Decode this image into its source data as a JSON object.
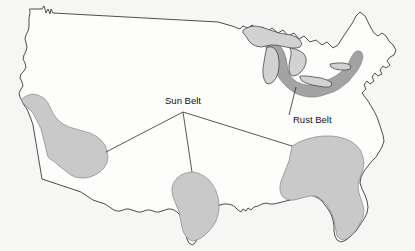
{
  "figure": {
    "kind": "thematic-map",
    "background_color": "#f6f6f4",
    "outline_color": "#3a3a3a"
  },
  "labels": [
    {
      "id": "sun-belt",
      "text": "Sun Belt",
      "x": 183,
      "y": 104,
      "anchor": "middle"
    },
    {
      "id": "rust-belt",
      "text": "Rust Belt",
      "x": 293,
      "y": 123,
      "anchor": "start"
    }
  ],
  "regions": [
    {
      "id": "sun-belt-west",
      "name": "Sun Belt (Southwest)",
      "color": "#c9c9c9",
      "label_ref": "sun-belt"
    },
    {
      "id": "sun-belt-texas",
      "name": "Sun Belt (Texas)",
      "color": "#c9c9c9",
      "label_ref": "sun-belt"
    },
    {
      "id": "sun-belt-southeast",
      "name": "Sun Belt (Southeast)",
      "color": "#c9c9c9",
      "label_ref": "sun-belt"
    },
    {
      "id": "rust-belt-region",
      "name": "Rust Belt (Great Lakes / Midwest)",
      "color": "#a3a3a3",
      "label_ref": "rust-belt"
    }
  ],
  "lakes": [
    {
      "id": "lake-superior",
      "name": "Lake Superior",
      "color": "#d2d2d2"
    },
    {
      "id": "lake-michigan",
      "name": "Lake Michigan",
      "color": "#d2d2d2"
    },
    {
      "id": "lake-huron",
      "name": "Lake Huron",
      "color": "#d2d2d2"
    },
    {
      "id": "lake-erie",
      "name": "Lake Erie",
      "color": "#d2d2d2"
    },
    {
      "id": "lake-ontario",
      "name": "Lake Ontario",
      "color": "#d2d2d2"
    }
  ],
  "leaders": [
    {
      "id": "leader-sun-west",
      "from_x": 183,
      "from_y": 112,
      "to_x": 106,
      "to_y": 152
    },
    {
      "id": "leader-sun-texas",
      "from_x": 183,
      "from_y": 112,
      "to_x": 192,
      "to_y": 172
    },
    {
      "id": "leader-sun-southeast",
      "from_x": 183,
      "from_y": 112,
      "to_x": 292,
      "to_y": 146
    },
    {
      "id": "leader-rust",
      "from_x": 289,
      "from_y": 115,
      "to_x": 296,
      "to_y": 87
    }
  ]
}
